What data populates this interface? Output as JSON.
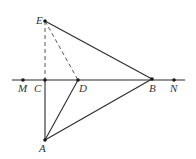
{
  "diagram": {
    "type": "geometry-figure",
    "points": {
      "E": {
        "label": "E"
      },
      "M": {
        "label": "M"
      },
      "C": {
        "label": "C"
      },
      "D": {
        "label": "D"
      },
      "B": {
        "label": "B"
      },
      "N": {
        "label": "N"
      },
      "A": {
        "label": "A"
      }
    },
    "lines": [
      {
        "name": "line-MN",
        "from": "M",
        "to": "N",
        "style": "solid",
        "extended": true
      },
      {
        "name": "segment-EB",
        "from": "E",
        "to": "B",
        "style": "solid"
      },
      {
        "name": "segment-AB",
        "from": "A",
        "to": "B",
        "style": "solid"
      },
      {
        "name": "segment-AD",
        "from": "A",
        "to": "D",
        "style": "solid"
      },
      {
        "name": "segment-AC",
        "from": "A",
        "to": "C",
        "style": "solid"
      },
      {
        "name": "segment-EC",
        "from": "E",
        "to": "C",
        "style": "dashed"
      },
      {
        "name": "segment-ED",
        "from": "E",
        "to": "D",
        "style": "dashed"
      }
    ],
    "colors": {
      "line": "#2b2b2b",
      "dashed": "#555555",
      "label": "#333333",
      "background": "#ffffff"
    }
  }
}
